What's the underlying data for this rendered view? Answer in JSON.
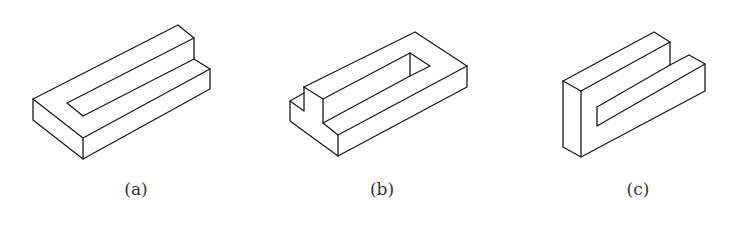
{
  "figure": {
    "panels": [
      {
        "id": "a",
        "caption": "(a)",
        "caption_x": 136,
        "lines": [
          [
            [
              33,
              99
            ],
            [
              178,
              25
            ],
            [
              194,
              38
            ],
            [
              194,
              59
            ],
            [
              210,
              69
            ],
            [
              210,
              89
            ],
            [
              83,
              159
            ],
            [
              33,
              120
            ],
            [
              33,
              99
            ]
          ],
          [
            [
              33,
              99
            ],
            [
              83,
              138
            ],
            [
              210,
              69
            ]
          ],
          [
            [
              83,
              138
            ],
            [
              83,
              159
            ]
          ],
          [
            [
              194,
              38
            ],
            [
              67,
              103
            ],
            [
              83,
              116
            ],
            [
              194,
              59
            ]
          ]
        ]
      },
      {
        "id": "b",
        "caption": "(b)",
        "caption_x": 382,
        "lines": [
          [
            [
              304,
              87
            ],
            [
              415,
              32
            ],
            [
              467,
              66
            ],
            [
              467,
              87
            ],
            [
              338,
              156
            ],
            [
              290,
              121
            ],
            [
              290,
              101
            ],
            [
              304,
              93
            ]
          ],
          [
            [
              304,
              87
            ],
            [
              304,
              111
            ],
            [
              290,
              101
            ]
          ],
          [
            [
              304,
              87
            ],
            [
              323,
              99
            ],
            [
              323,
              123
            ],
            [
              338,
              135
            ],
            [
              467,
              66
            ]
          ],
          [
            [
              338,
              135
            ],
            [
              338,
              156
            ]
          ],
          [
            [
              323,
              99
            ],
            [
              410,
              53
            ],
            [
              430,
              66
            ],
            [
              410,
              76
            ],
            [
              323,
              123
            ]
          ],
          [
            [
              410,
              53
            ],
            [
              410,
              76
            ]
          ]
        ]
      },
      {
        "id": "c",
        "caption": "(c)",
        "caption_x": 638,
        "lines": [
          [
            [
              563,
              81
            ],
            [
              654,
              32
            ],
            [
              670,
              42
            ],
            [
              670,
              65
            ],
            [
              689,
              55
            ],
            [
              705,
              64
            ],
            [
              705,
              91
            ],
            [
              581,
              157
            ],
            [
              563,
              147
            ],
            [
              563,
              81
            ]
          ],
          [
            [
              563,
              81
            ],
            [
              581,
              91
            ],
            [
              670,
              42
            ]
          ],
          [
            [
              581,
              91
            ],
            [
              581,
              157
            ]
          ],
          [
            [
              670,
              65
            ],
            [
              597,
              107
            ],
            [
              597,
              126
            ],
            [
              705,
              64
            ]
          ]
        ]
      }
    ]
  },
  "colors": {
    "stroke": "#1a1a1a",
    "caption": "#333333",
    "background": "#ffffff"
  }
}
